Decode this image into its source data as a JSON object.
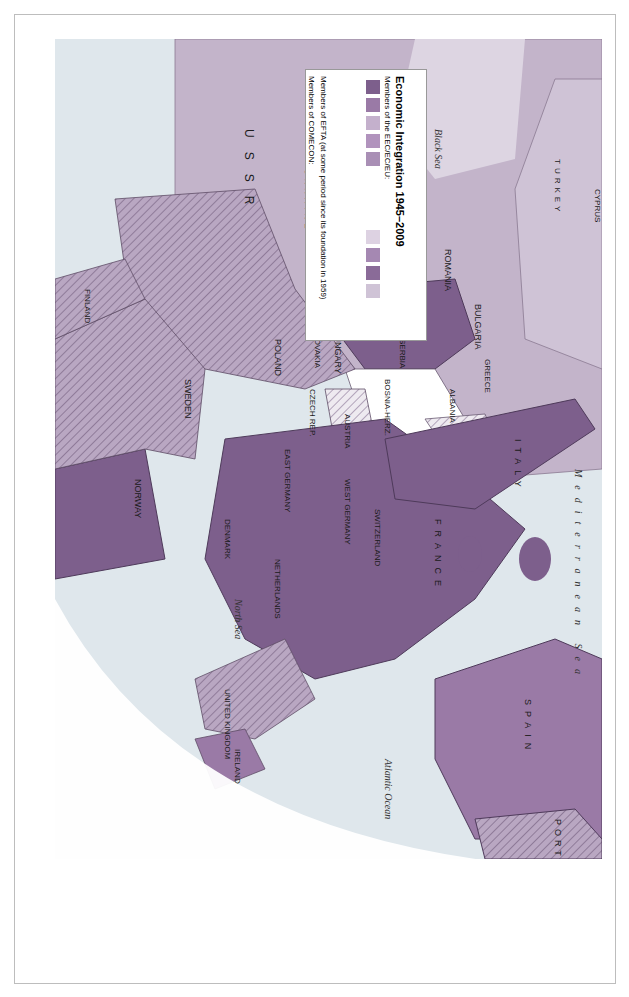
{
  "legend": {
    "title": "Economic Integration 1945–2009",
    "eec_header": "Members of the EEC/EC/EU:",
    "eec_items": [
      {
        "label": "1957 (and of ECSC since 1952)",
        "color": "#7d5f8c"
      },
      {
        "label": "1973",
        "color": "#9a7aa6"
      },
      {
        "label": "1981",
        "color": "#c4b0cc"
      },
      {
        "label": "1986",
        "color": "#b193bd"
      },
      {
        "label": "1990",
        "color": "#a98fb5"
      },
      {
        "label": "1995",
        "color": "#ddd2e2"
      },
      {
        "label": "2004",
        "color": "#a588b2"
      },
      {
        "label": "2007",
        "color": "#8a6b98"
      },
      {
        "label": "Candidate country",
        "color": "#cfc3d6"
      }
    ],
    "efta_label": "Members of EFTA (at some period since its foundation in 1959)",
    "comecon_header": "Members of COMECON:",
    "comecon_items": [
      {
        "label": "1949–91",
        "color": "#b8a6c1"
      },
      {
        "label": "1949–90",
        "color": "#ad9ab7"
      },
      {
        "label": "1949–61",
        "color": "hatched"
      }
    ]
  },
  "seas": [
    "Black Sea",
    "North Sea",
    "Atlantic Ocean",
    "Mediterranean Sea"
  ],
  "countries": [
    "ICELAND",
    "NORWAY",
    "SWEDEN",
    "FINLAND",
    "ESTONIA",
    "LATVIA",
    "LITHUANIA",
    "BELARUS",
    "U S S R",
    "UKRAINE",
    "MOLDOVA",
    "ROMANIA",
    "BULGARIA",
    "TURKEY",
    "CYPRUS",
    "GREECE",
    "ALBANIA",
    "MACEDONIA",
    "SERBIA",
    "MONT.",
    "BOSNIA-HERZ.",
    "CROATIA",
    "SLOVENIA",
    "HUNGARY",
    "SLOVAKIA",
    "AUSTRIA",
    "CZECH REP.",
    "POLAND",
    "EAST GERMANY",
    "WEST GERMANY",
    "LIECHTENSTEIN",
    "SWITZERLAND",
    "ITALY",
    "MALTA",
    "DENMARK",
    "NETHERLANDS",
    "BELGIUM",
    "LUXEMBOURG",
    "FRANCE",
    "UNITED KINGDOM",
    "IRELAND",
    "SPAIN",
    "PORTUGAL"
  ],
  "cities": [
    "Reykjavik",
    "Oslo",
    "Stockholm",
    "Helsinki",
    "Tallinn",
    "Riga",
    "Vilnius",
    "Warsaw",
    "Berlin",
    "Copenhagen",
    "Prague",
    "Vienna",
    "Bratislava",
    "Budapest",
    "Ljubljana",
    "Zagreb",
    "Belgrade",
    "Bucharest",
    "Sofia",
    "Skopje",
    "Tirana",
    "Athens",
    "Ankara",
    "Rome",
    "Bern",
    "Bonn",
    "Amsterdam",
    "Brussels",
    "Paris",
    "London",
    "Dublin",
    "Madrid",
    "Lisbon",
    "Corsica",
    "Sardinia"
  ],
  "graticule": [
    "50",
    "40",
    "30",
    "20",
    "10"
  ]
}
